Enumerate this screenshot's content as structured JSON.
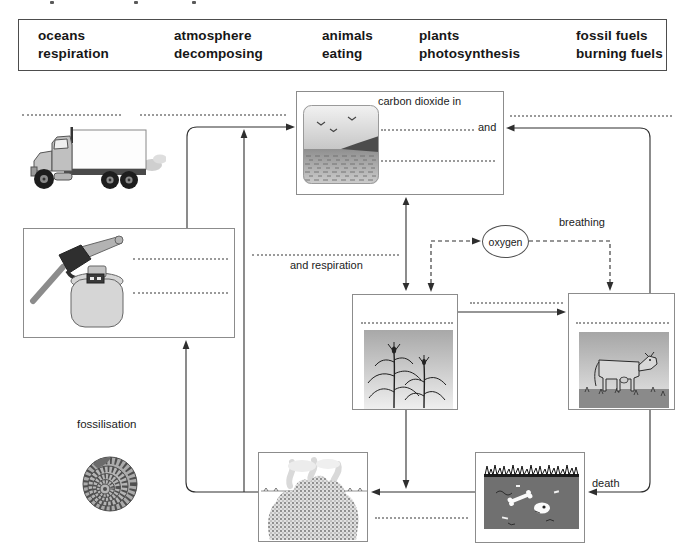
{
  "word_bank": {
    "row1": [
      "oceans",
      "atmosphere",
      "animals",
      "plants",
      "fossil fuels"
    ],
    "row2": [
      "respiration",
      "decomposing",
      "eating",
      "photosynthesis",
      "burning fuels"
    ]
  },
  "labels": {
    "carbon_box_title": "carbon dioxide in",
    "and": "and",
    "and_respiration": "and respiration",
    "breathing": "breathing",
    "oxygen": "oxygen",
    "death": "death",
    "fossilisation": "fossilisation"
  },
  "illustrations": {
    "truck": "lorry-with-exhaust-smoke",
    "atmosphere_ocean": "coast-sea-and-birds",
    "fuel_pump": "petrol-nozzle-and-gas-cylinder",
    "plants": "maize-plants",
    "animals": "cow-on-grass",
    "dead_remains": "bones-buried-in-soil",
    "compost": "steaming-compost-heap",
    "fossil": "ammonite-fossil"
  },
  "colors": {
    "text": "#1a1a1a",
    "box_border": "#8c8c8c",
    "word_bank_border": "#4d4d4d",
    "arrow": "#2e2e2e",
    "dotted_blank": "#9a9a9a"
  }
}
